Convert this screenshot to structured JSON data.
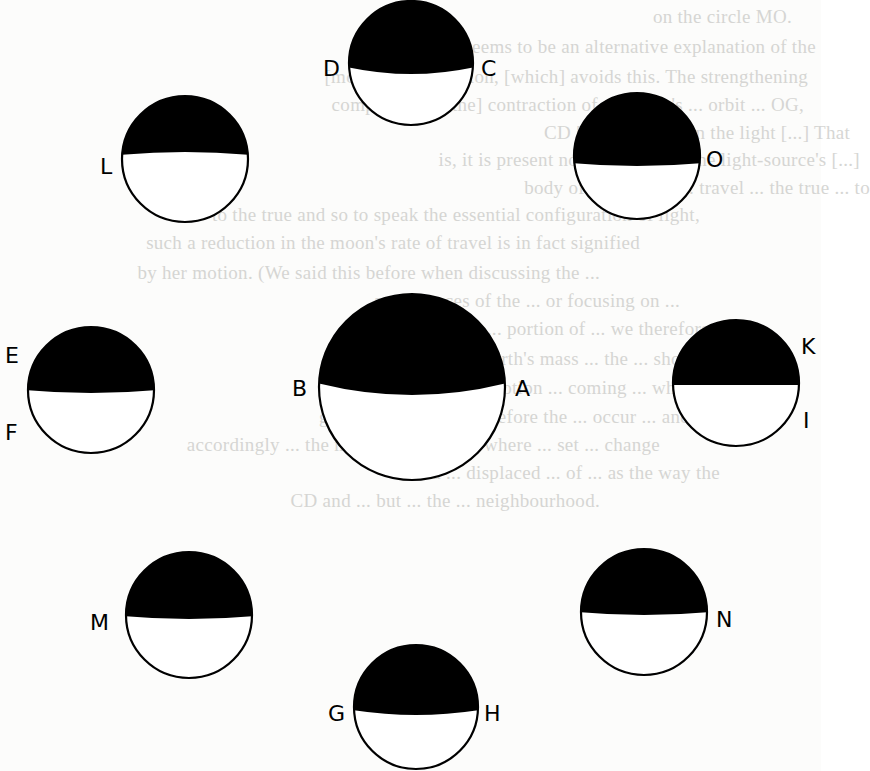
{
  "figure": {
    "type": "moon-phase-diagram",
    "colors": {
      "shadow": "#000000",
      "lit": "#ffffff",
      "outline": "#000000",
      "paper": "#fcfcfb",
      "bleed_text": "#c9c9c6"
    },
    "circles": [
      {
        "id": "DC",
        "cx": 411,
        "cy": 63,
        "r": 62,
        "shade_y_edge": 67,
        "shade_sag": 7,
        "left_label": "D",
        "right_label": "C"
      },
      {
        "id": "L",
        "cx": 185,
        "cy": 159,
        "r": 63,
        "shade_y_edge": 155,
        "shade_sag": -3,
        "left_label": "L",
        "right_label": ""
      },
      {
        "id": "O",
        "cx": 637,
        "cy": 156,
        "r": 63,
        "shade_y_edge": 163,
        "shade_sag": 3,
        "left_label": "",
        "right_label": "O"
      },
      {
        "id": "AB",
        "cx": 412,
        "cy": 387,
        "r": 93,
        "shade_y_edge": 383,
        "shade_sag": 12,
        "left_label": "B",
        "right_label": "A"
      },
      {
        "id": "EF",
        "cx": 91,
        "cy": 390,
        "r": 63,
        "shade_y_edge": 390,
        "shade_sag": 3,
        "left_label": "E",
        "right_label": "",
        "extra_left_label": "F"
      },
      {
        "id": "KI",
        "cx": 736,
        "cy": 383,
        "r": 63,
        "shade_y_edge": 385,
        "shade_sag": 0,
        "left_label": "",
        "right_label": "K",
        "extra_right_label": "I"
      },
      {
        "id": "M",
        "cx": 189,
        "cy": 615,
        "r": 63,
        "shade_y_edge": 616,
        "shade_sag": 3,
        "left_label": "M",
        "right_label": ""
      },
      {
        "id": "N",
        "cx": 644,
        "cy": 612,
        "r": 63,
        "shade_y_edge": 612,
        "shade_sag": 3,
        "left_label": "",
        "right_label": "N"
      },
      {
        "id": "GH",
        "cx": 416,
        "cy": 707,
        "r": 62,
        "shade_y_edge": 710,
        "shade_sag": 5,
        "left_label": "G",
        "right_label": "H"
      }
    ],
    "labels": [
      {
        "text": "D",
        "x": 323,
        "y": 76
      },
      {
        "text": "C",
        "x": 481,
        "y": 76
      },
      {
        "text": "L",
        "x": 100,
        "y": 174
      },
      {
        "text": "O",
        "x": 706,
        "y": 167
      },
      {
        "text": "E",
        "x": 5,
        "y": 363
      },
      {
        "text": "F",
        "x": 5,
        "y": 440
      },
      {
        "text": "B",
        "x": 292,
        "y": 396
      },
      {
        "text": "A",
        "x": 515,
        "y": 396
      },
      {
        "text": "K",
        "x": 801,
        "y": 354
      },
      {
        "text": "I",
        "x": 803,
        "y": 428
      },
      {
        "text": "M",
        "x": 90,
        "y": 630
      },
      {
        "text": "N",
        "x": 716,
        "y": 627
      },
      {
        "text": "G",
        "x": 328,
        "y": 721
      },
      {
        "text": "H",
        "x": 484,
        "y": 721
      }
    ]
  },
  "background_bleed_text": [
    {
      "text": "on the circle MO.",
      "x": 632,
      "y": 22
    },
    {
      "text": "Now, there seems to be an alternative explanation of the",
      "x": 656,
      "y": 52
    },
    {
      "text": "[moon's] acceleration, [which] avoids this. The strengthening",
      "x": 648,
      "y": 82
    },
    {
      "text": "component [of the] contraction of the earth's ... orbit ... OG,",
      "x": 644,
      "y": 110
    },
    {
      "text": "CD [...] is present in the light [...] That",
      "x": 690,
      "y": 138
    },
    {
      "text": "is, it is present not in respect of the light-source's [...]",
      "x": 700,
      "y": 165
    },
    {
      "text": "body of the eclipse ... travel ... the true ... to",
      "x": 710,
      "y": 193
    },
    {
      "text": "to the true and so to speak the essential configuration of light,",
      "x": 540,
      "y": 220
    },
    {
      "text": "such a reduction in the moon's rate of travel is in fact signified",
      "x": 480,
      "y": 248
    },
    {
      "text": "by her motion. (We said this before when discussing the ...",
      "x": 440,
      "y": 278
    },
    {
      "text": "appearances of the ... or focusing on ...",
      "x": 520,
      "y": 306
    },
    {
      "text": "... portion of ... we therefore ...",
      "x": 570,
      "y": 334
    },
    {
      "text": "the earth's mass ... the ... showing",
      "x": 560,
      "y": 364
    },
    {
      "text": "in the moon's ... motion ... coming ... which",
      "x": 540,
      "y": 393
    },
    {
      "text": "generally ... the ... therefore the ... occur ... and",
      "x": 530,
      "y": 422
    },
    {
      "text": "accordingly ... the moon's changes to where ... set ... change",
      "x": 500,
      "y": 450
    },
    {
      "text": "... a ... displaced ... of ... as the way the",
      "x": 560,
      "y": 478
    },
    {
      "text": "CD and ... but ... the ... neighbourhood.",
      "x": 440,
      "y": 506
    }
  ]
}
